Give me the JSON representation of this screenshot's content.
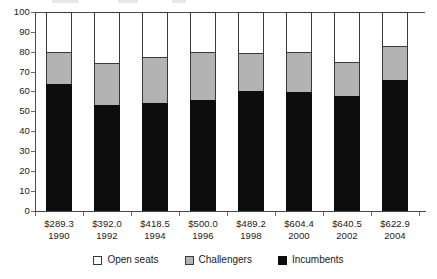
{
  "chart_data": {
    "type": "bar",
    "stacked": true,
    "title": "",
    "subtitle": "",
    "xlabel": "",
    "ylabel": "",
    "ylim": [
      0,
      100
    ],
    "yticks": [
      0,
      10,
      20,
      30,
      40,
      50,
      60,
      70,
      80,
      90,
      100
    ],
    "grid": false,
    "legend_position": "bottom",
    "categories": [
      "1990",
      "1992",
      "1994",
      "1996",
      "1998",
      "2000",
      "2002",
      "2004"
    ],
    "category_amounts": [
      "$289.3",
      "$392.0",
      "$418.5",
      "$500.0",
      "$489.2",
      "$604.4",
      "$640.5",
      "$622.9"
    ],
    "series": [
      {
        "name": "Incumbents",
        "color": "#0d0d0d",
        "values": [
          64.0,
          53.2,
          54.3,
          55.8,
          60.3,
          59.8,
          57.8,
          66.0
        ]
      },
      {
        "name": "Challengers",
        "color": "#b3b3b3",
        "values": [
          16.0,
          21.1,
          23.0,
          24.2,
          19.2,
          20.2,
          17.2,
          17.0
        ]
      },
      {
        "name": "Open seats",
        "color": "#ffffff",
        "values": [
          20.0,
          25.7,
          22.7,
          20.0,
          20.5,
          20.0,
          25.0,
          17.0
        ]
      }
    ],
    "cumulative_tops": {
      "incumbents": [
        64.0,
        53.2,
        54.3,
        55.8,
        60.3,
        59.8,
        57.8,
        66.0
      ],
      "challengers": [
        80.0,
        74.3,
        77.3,
        80.0,
        79.5,
        80.0,
        75.0,
        83.0
      ],
      "open_seats": [
        100,
        100,
        100,
        100,
        100,
        100,
        100,
        100
      ]
    }
  },
  "yaxis": {
    "ticks": [
      "100",
      "90",
      "80",
      "70",
      "60",
      "50",
      "40",
      "30",
      "20",
      "10",
      "0"
    ]
  },
  "xaxis": {
    "labels": [
      {
        "amount": "$289.3",
        "year": "1990"
      },
      {
        "amount": "$392.0",
        "year": "1992"
      },
      {
        "amount": "$418.5",
        "year": "1994"
      },
      {
        "amount": "$500.0",
        "year": "1996"
      },
      {
        "amount": "$489.2",
        "year": "1998"
      },
      {
        "amount": "$604.4",
        "year": "2000"
      },
      {
        "amount": "$640.5",
        "year": "2002"
      },
      {
        "amount": "$622.9",
        "year": "2004"
      }
    ]
  },
  "legend": {
    "items": [
      {
        "label": "Open seats",
        "color": "#ffffff"
      },
      {
        "label": "Challengers",
        "color": "#b3b3b3"
      },
      {
        "label": "Incumbents",
        "color": "#0d0d0d"
      }
    ]
  },
  "colors": {
    "incumbents": "#0d0d0d",
    "challengers": "#b3b3b3",
    "open_seats": "#ffffff",
    "axis": "#4a4a4a",
    "text": "#1a1a1a"
  }
}
